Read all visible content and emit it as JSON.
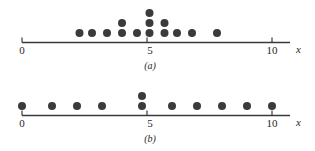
{
  "figure": {
    "title": "",
    "panel_count": 2
  },
  "chart_data": [
    {
      "type": "scatter",
      "plot_style": "dotplot",
      "panel_label": "(a)",
      "title": "",
      "xlabel": "x",
      "ylabel": "",
      "xlim": [
        0,
        11.2
      ],
      "xticks": [
        0,
        5,
        10
      ],
      "xticklabels": [
        "0",
        "5",
        "10"
      ],
      "grid": false,
      "legend": null,
      "n_points": 15,
      "values": [
        2.3,
        2.8,
        3.4,
        4.0,
        4.0,
        4.6,
        5.1,
        5.1,
        5.1,
        5.7,
        5.7,
        6.2,
        6.8,
        7.8
      ],
      "stacks": [
        {
          "x": 2.3,
          "count": 1
        },
        {
          "x": 2.8,
          "count": 1
        },
        {
          "x": 3.4,
          "count": 1
        },
        {
          "x": 4.0,
          "count": 2
        },
        {
          "x": 4.6,
          "count": 1
        },
        {
          "x": 5.1,
          "count": 3
        },
        {
          "x": 5.7,
          "count": 2
        },
        {
          "x": 6.2,
          "count": 1
        },
        {
          "x": 6.8,
          "count": 1
        },
        {
          "x": 7.8,
          "count": 1
        }
      ]
    },
    {
      "type": "scatter",
      "plot_style": "dotplot",
      "panel_label": "(b)",
      "title": "",
      "xlabel": "x",
      "ylabel": "",
      "xlim": [
        0,
        11.2
      ],
      "xticks": [
        0,
        5,
        10
      ],
      "xticklabels": [
        "0",
        "5",
        "10"
      ],
      "grid": false,
      "legend": null,
      "n_points": 11,
      "values": [
        0.0,
        1.2,
        2.2,
        3.2,
        4.8,
        4.8,
        6.0,
        7.0,
        8.0,
        9.0,
        10.0
      ],
      "stacks": [
        {
          "x": 0.0,
          "count": 1
        },
        {
          "x": 1.2,
          "count": 1
        },
        {
          "x": 2.2,
          "count": 1
        },
        {
          "x": 3.2,
          "count": 1
        },
        {
          "x": 4.8,
          "count": 2
        },
        {
          "x": 6.0,
          "count": 1
        },
        {
          "x": 7.0,
          "count": 1
        },
        {
          "x": 8.0,
          "count": 1
        },
        {
          "x": 9.0,
          "count": 1
        },
        {
          "x": 10.0,
          "count": 1
        }
      ]
    }
  ],
  "panel_a": {
    "caption": "(a)",
    "axis_variable": "x",
    "ticks": [
      {
        "label": "0"
      },
      {
        "label": "5"
      },
      {
        "label": "10"
      }
    ]
  },
  "panel_b": {
    "caption": "(b)",
    "axis_variable": "x",
    "ticks": [
      {
        "label": "0"
      },
      {
        "label": "5"
      },
      {
        "label": "10"
      }
    ]
  },
  "colors": {
    "dot": "#3b3b3b",
    "axis": "#3a3a3a",
    "text": "#1f1f1f",
    "background": "#ffffff"
  }
}
